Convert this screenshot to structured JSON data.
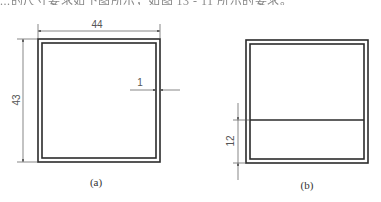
{
  "header": {
    "cropped_text": "...的尺寸要求如下图所示，如图 13 - 11 所示的要求。"
  },
  "figures": [
    {
      "id": "a",
      "caption": "(a)",
      "dimensions": {
        "width": "44",
        "height": "43",
        "wall": "1"
      }
    },
    {
      "id": "b",
      "caption": "(b)",
      "dimensions": {
        "line_offset": "12"
      }
    }
  ],
  "colors": {
    "line": "#2b2b2b",
    "dimension": "#555555"
  }
}
